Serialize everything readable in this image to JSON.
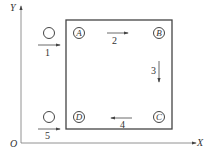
{
  "axes": {
    "y_label": "Y",
    "x_label": "X",
    "origin_label": "O"
  },
  "stations": [
    {
      "label": "A"
    },
    {
      "label": "B"
    },
    {
      "label": "C"
    },
    {
      "label": "D"
    }
  ],
  "moves": [
    {
      "label": "1",
      "direction": "right"
    },
    {
      "label": "2",
      "direction": "right"
    },
    {
      "label": "3",
      "direction": "down"
    },
    {
      "label": "4",
      "direction": "left"
    },
    {
      "label": "5",
      "direction": "right"
    }
  ],
  "colors": {
    "line": "#444444",
    "axis": "#666666"
  }
}
